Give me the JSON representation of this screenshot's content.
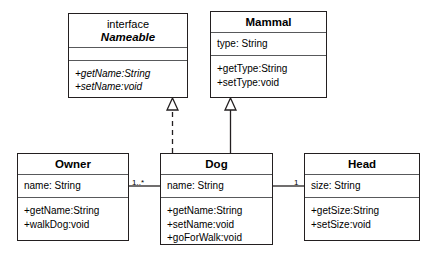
{
  "diagram": {
    "type": "uml-class-diagram",
    "background_color": "#ffffff",
    "line_color": "#231f20"
  },
  "classes": {
    "nameable": {
      "stereotype": "interface",
      "name": "Nameable",
      "attributes": [],
      "methods": [
        "+getName:String",
        "+setName:void"
      ]
    },
    "mammal": {
      "name": "Mammal",
      "attributes": [
        "type: String"
      ],
      "methods": [
        "+getType:String",
        "+setType:void"
      ]
    },
    "owner": {
      "name": "Owner",
      "attributes": [
        "name: String"
      ],
      "methods": [
        "+getName:String",
        "+walkDog:void"
      ]
    },
    "dog": {
      "name": "Dog",
      "attributes": [
        "name: String"
      ],
      "methods": [
        "+getName:String",
        "+setName:void",
        "+goForWalk:void"
      ]
    },
    "head": {
      "name": "Head",
      "attributes": [
        "size: String"
      ],
      "methods": [
        "+getSize:String",
        "+setSize:void"
      ]
    }
  },
  "relationships": {
    "realization": {
      "from": "Dog",
      "to": "Nameable",
      "style": "dashed",
      "arrow": "hollow-triangle"
    },
    "generalization": {
      "from": "Dog",
      "to": "Mammal",
      "style": "solid",
      "arrow": "hollow-triangle"
    },
    "owner_dog": {
      "from": "Owner",
      "to": "Dog",
      "style": "solid",
      "multiplicity_near_dog": "1..*"
    },
    "dog_head": {
      "from": "Dog",
      "to": "Head",
      "style": "solid",
      "multiplicity_near_head": "1"
    }
  }
}
